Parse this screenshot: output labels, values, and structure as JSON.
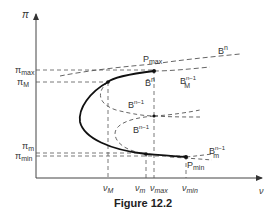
{
  "figure": {
    "caption": "Figure 12.2",
    "axes": {
      "y_label": "π",
      "x_label": "ν"
    },
    "y_ticks": {
      "pi_max": {
        "main": "π",
        "sub": "max"
      },
      "pi_M": {
        "main": "π",
        "sub": "M"
      },
      "pi_m": {
        "main": "π",
        "sub": "m"
      },
      "pi_min": {
        "main": "π",
        "sub": "min"
      }
    },
    "x_ticks": {
      "nu_M": {
        "main": "ν",
        "sub": "M"
      },
      "nu_m": {
        "main": "ν",
        "sub": "m"
      },
      "nu_max": {
        "main": "ν",
        "sub": "max"
      },
      "nu_min": {
        "main": "ν",
        "sub": "min"
      }
    },
    "curve_labels": {
      "Bn": {
        "main": "B",
        "sup": "n"
      },
      "Bbar_n": {
        "main": "B̄",
        "sup": "n"
      },
      "BM_n1": {
        "main": "B",
        "sub": "M",
        "sup": "n−1"
      },
      "Bn1_upper": {
        "main": "B",
        "sup": "n−1"
      },
      "Bn1_lower": {
        "main": "B",
        "sup": "n−1"
      },
      "Bm_n1": {
        "main": "B",
        "sub": "m",
        "sup": "n−1"
      },
      "P_max": {
        "main": "P",
        "sub": "max"
      },
      "P_min": {
        "main": "P",
        "sub": "min"
      }
    },
    "colors": {
      "curve": "#111111",
      "dashed": "#555555",
      "axis": "#444444",
      "text": "#333333"
    }
  }
}
